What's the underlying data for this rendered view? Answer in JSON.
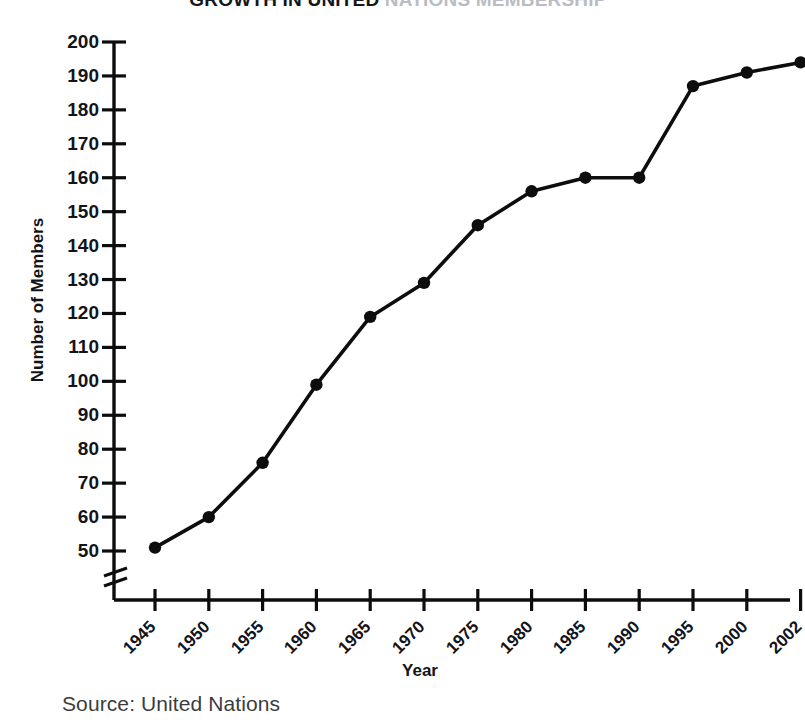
{
  "chart_data": {
    "type": "line",
    "title": "GROWTH IN UNITED NATIONS MEMBERSHIP",
    "title_visible_part": "GROWTH IN UNITED",
    "title_faded_part": " NATIONS MEMBERSHIP",
    "xlabel": "Year",
    "ylabel": "Number of Members",
    "categories": [
      "1945",
      "1950",
      "1955",
      "1960",
      "1965",
      "1970",
      "1975",
      "1980",
      "1985",
      "1990",
      "1995",
      "2000",
      "2002"
    ],
    "values": [
      51,
      60,
      76,
      99,
      119,
      129,
      146,
      156,
      160,
      160,
      187,
      191,
      194
    ],
    "ylim": [
      50,
      200
    ],
    "ytick_labels": [
      "200",
      "190",
      "180",
      "170",
      "160",
      "150",
      "140",
      "130",
      "120",
      "110",
      "100",
      "90",
      "80",
      "70",
      "60",
      "50"
    ],
    "ytick_values": [
      200,
      190,
      180,
      170,
      160,
      150,
      140,
      130,
      120,
      110,
      100,
      90,
      80,
      70,
      60,
      50
    ],
    "ytick_step": 10,
    "axis_break": true,
    "axis_break_note": "y-axis broken below 50",
    "grid": false,
    "legend": false,
    "marker": "filled-circle",
    "line_color": "#0d0d0d",
    "marker_color": "#0d0d0d",
    "axis_color": "#0d0d0d",
    "background_color": "#ffffff",
    "source": "Source: United Nations"
  },
  "caption": {
    "source_text": "Source: United Nations"
  }
}
